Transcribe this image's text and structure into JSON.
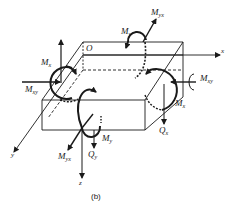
{
  "figure": {
    "caption": "(b)",
    "origin_label": "O",
    "axes": {
      "x": "x",
      "y": "y",
      "z": "z"
    },
    "labels": {
      "Mx_left": {
        "base": "M",
        "sub": "x"
      },
      "Mxy_left": {
        "base": "M",
        "sub": "xy"
      },
      "My_top": {
        "base": "M",
        "sub": "y"
      },
      "Myx_top": {
        "base": "M",
        "sub": "yx"
      },
      "Mxy_right": {
        "base": "M",
        "sub": "xy"
      },
      "Mx_right": {
        "base": "M",
        "sub": "x"
      },
      "Qx": {
        "base": "Q",
        "sub": "x"
      },
      "My_bottom": {
        "base": "M",
        "sub": "y"
      },
      "Myx_bottom": {
        "base": "M",
        "sub": "yx"
      },
      "Qy": {
        "base": "Q",
        "sub": "y"
      }
    },
    "colors": {
      "ink": "#1a1a1a",
      "background": "#ffffff"
    }
  }
}
